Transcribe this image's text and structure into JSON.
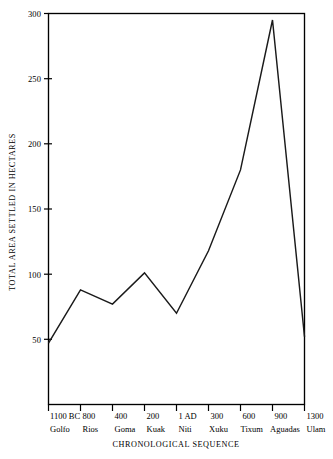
{
  "chart_data": {
    "type": "line",
    "title": "",
    "subtitle": "",
    "xlabel": "CHRONOLOGICAL SEQUENCE",
    "ylabel": "TOTAL AREA SETTLED IN HECTARES",
    "ylim": [
      0,
      300
    ],
    "yticks": [
      50,
      100,
      150,
      200,
      250,
      300
    ],
    "ytick_labels": [
      "50",
      "100",
      "150",
      "200",
      "250",
      "300"
    ],
    "grid": false,
    "legend": false,
    "legend_position": "none",
    "categories": [
      "Golfo",
      "Rios",
      "Goma",
      "Kuak",
      "Niti",
      "Xuku",
      "Tixum",
      "Aguadas",
      "Ulam"
    ],
    "xtick_labels": [
      "1100 BC",
      "800",
      "400",
      "200",
      "1 AD",
      "300",
      "600",
      "900",
      "1300"
    ],
    "values": [
      47,
      88,
      77,
      101,
      70,
      118,
      180,
      295,
      52
    ],
    "series": [
      {
        "name": "Total area settled",
        "values": [
          47,
          88,
          77,
          101,
          70,
          118,
          180,
          295,
          52
        ]
      }
    ],
    "points": [
      {
        "category": "Golfo",
        "date": "1100 BC",
        "value": 47
      },
      {
        "category": "Rios",
        "date": "800",
        "value": 88
      },
      {
        "category": "Goma",
        "date": "400",
        "value": 77
      },
      {
        "category": "Kuak",
        "date": "200",
        "value": 101
      },
      {
        "category": "Niti",
        "date": "1 AD",
        "value": 70
      },
      {
        "category": "Xuku",
        "date": "300",
        "value": 118
      },
      {
        "category": "Tixum",
        "date": "600",
        "value": 180
      },
      {
        "category": "Aguadas",
        "date": "900",
        "value": 295
      },
      {
        "category": "Ulam",
        "date": "1300",
        "value": 52
      }
    ],
    "line_color": "#1a1a1a",
    "axis_color": "#000000",
    "background_color": "#ffffff"
  }
}
